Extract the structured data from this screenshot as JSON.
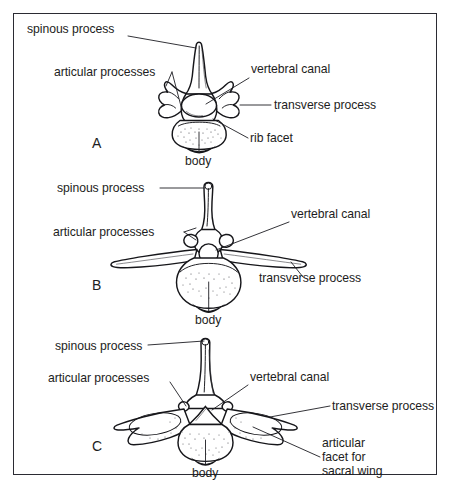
{
  "figure": {
    "background_color": "#ffffff",
    "border_color": "#2b2b33",
    "ink_color": "#16161a"
  },
  "panels": [
    {
      "letter": "A",
      "name": "thoracic-vertebra",
      "labels": [
        {
          "key": "spinous_process",
          "text": "spinous process"
        },
        {
          "key": "articular_processes",
          "text": "articular processes"
        },
        {
          "key": "vertebral_canal",
          "text": "vertebral canal"
        },
        {
          "key": "transverse_process",
          "text": "transverse process"
        },
        {
          "key": "rib_facet",
          "text": "rib facet"
        },
        {
          "key": "body",
          "text": "body"
        }
      ]
    },
    {
      "letter": "B",
      "name": "lumbar-vertebra",
      "labels": [
        {
          "key": "spinous_process",
          "text": "spinous process"
        },
        {
          "key": "articular_processes",
          "text": "articular processes"
        },
        {
          "key": "vertebral_canal",
          "text": "vertebral canal"
        },
        {
          "key": "transverse_process",
          "text": "transverse process"
        },
        {
          "key": "body",
          "text": "body"
        }
      ]
    },
    {
      "letter": "C",
      "name": "last-lumbar-vertebra",
      "labels": [
        {
          "key": "spinous_process",
          "text": "spinous process"
        },
        {
          "key": "articular_processes",
          "text": "articular processes"
        },
        {
          "key": "vertebral_canal",
          "text": "vertebral canal"
        },
        {
          "key": "transverse_process",
          "text": "transverse process"
        },
        {
          "key": "articular_facet_line1",
          "text": "articular"
        },
        {
          "key": "articular_facet_line2",
          "text": "facet for"
        },
        {
          "key": "articular_facet_line3",
          "text": "sacral wing"
        },
        {
          "key": "body",
          "text": "body"
        }
      ]
    }
  ],
  "panel_a": {
    "letter": "A",
    "spinous_process": "spinous process",
    "articular_processes": "articular processes",
    "vertebral_canal": "vertebral canal",
    "transverse_process": "transverse process",
    "rib_facet": "rib facet",
    "body": "body"
  },
  "panel_b": {
    "letter": "B",
    "spinous_process": "spinous process",
    "articular_processes": "articular processes",
    "vertebral_canal": "vertebral canal",
    "transverse_process": "transverse process",
    "body": "body"
  },
  "panel_c": {
    "letter": "C",
    "spinous_process": "spinous process",
    "articular_processes": "articular processes",
    "vertebral_canal": "vertebral canal",
    "transverse_process": "transverse process",
    "articular_facet_line1": "articular",
    "articular_facet_line2": "facet for",
    "articular_facet_line3": "sacral wing",
    "body": "body"
  }
}
